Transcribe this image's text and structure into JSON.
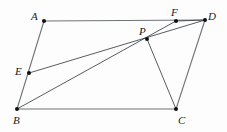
{
  "figure": {
    "canvas": {
      "width": 227,
      "height": 132
    },
    "style": {
      "background_color": "#fdfdfd",
      "outline_color": "#6e7376",
      "chord_color": "#3b3f42",
      "point_color": "#101010",
      "label_color": "#1a1a1a",
      "outline_width": 1.1,
      "chord_width": 0.85,
      "point_radius": 2.0
    },
    "points": [
      {
        "id": "A",
        "label": "A",
        "x": 44,
        "y": 21,
        "label_x": 31,
        "label_y": 11,
        "marker": true
      },
      {
        "id": "B",
        "label": "B",
        "x": 17,
        "y": 109,
        "label_x": 13,
        "label_y": 115,
        "marker": true
      },
      {
        "id": "C",
        "label": "C",
        "x": 176,
        "y": 109,
        "label_x": 178,
        "label_y": 115,
        "marker": true
      },
      {
        "id": "D",
        "label": "D",
        "x": 205,
        "y": 20,
        "label_x": 208,
        "label_y": 11,
        "marker": true
      },
      {
        "id": "E",
        "label": "E",
        "x": 29,
        "y": 73,
        "label_x": 15,
        "label_y": 66,
        "marker": true
      },
      {
        "id": "F",
        "label": "F",
        "x": 176,
        "y": 21,
        "label_x": 171,
        "label_y": 7,
        "marker": true
      },
      {
        "id": "P",
        "label": "P",
        "x": 147,
        "y": 39,
        "label_x": 139,
        "label_y": 26,
        "marker": true
      }
    ],
    "segments": [
      {
        "id": "AD",
        "from": "A",
        "to": "D",
        "kind": "outline",
        "name": "segment-a-d"
      },
      {
        "id": "BC",
        "from": "B",
        "to": "C",
        "kind": "outline",
        "name": "segment-b-c"
      },
      {
        "id": "AB",
        "from": "A",
        "to": "B",
        "kind": "outline",
        "name": "segment-a-b"
      },
      {
        "id": "CD",
        "from": "C",
        "to": "D",
        "kind": "outline",
        "name": "segment-c-d"
      },
      {
        "id": "ED",
        "from": "E",
        "to": "D",
        "kind": "chord",
        "name": "segment-e-d"
      },
      {
        "id": "BF",
        "from": "B",
        "to": "F",
        "kind": "chord",
        "name": "segment-b-f"
      },
      {
        "id": "PC",
        "from": "P",
        "to": "C",
        "kind": "chord",
        "name": "segment-p-c"
      },
      {
        "id": "FD",
        "from": "F",
        "to": "D",
        "kind": "chord",
        "name": "segment-f-d"
      }
    ]
  }
}
